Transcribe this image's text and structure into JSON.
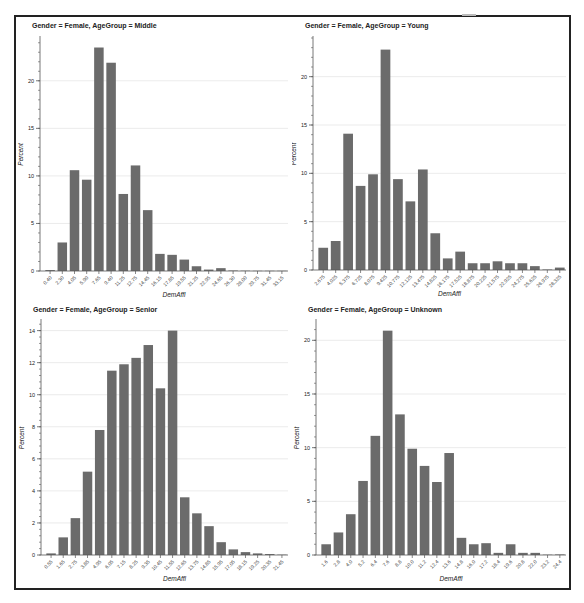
{
  "figure": {
    "bar_color": "#6b6b6b",
    "bar_edge_color": "#ffffff",
    "grid_color": "#e6e6e6",
    "axis_color": "#555555",
    "text_color": "#222222"
  },
  "chart_data": [
    {
      "type": "bar",
      "title": "Gender = Female, AgeGroup = Middle",
      "xlabel": "DemAffl",
      "ylabel": "Percent",
      "ylim": [
        0,
        24.5
      ],
      "yticks": [
        0,
        5,
        10,
        15,
        20
      ],
      "grid": true,
      "categories": [
        "0.40",
        "2.30",
        "4.05",
        "5.90",
        "7.65",
        "9.40",
        "11.25",
        "12.75",
        "14.45",
        "16.15",
        "17.85",
        "19.55",
        "21.25",
        "22.95",
        "24.65",
        "26.30",
        "28.00",
        "29.75",
        "31.45",
        "33.15"
      ],
      "values": [
        0.1,
        3.0,
        10.6,
        9.6,
        23.5,
        21.9,
        8.1,
        11.1,
        6.4,
        1.8,
        1.7,
        1.2,
        0.5,
        0.15,
        0.3,
        0.05,
        0.03,
        0.02,
        0.02,
        0.02
      ]
    },
    {
      "type": "bar",
      "title": "Gender = Female, AgeGroup = Young",
      "xlabel": "DemAffl",
      "ylabel": "Percent",
      "ylim": [
        0,
        24
      ],
      "yticks": [
        0,
        5,
        10,
        15,
        20
      ],
      "grid": true,
      "categories": [
        "2.675",
        "4.025",
        "5.375",
        "6.725",
        "8.075",
        "9.425",
        "10.775",
        "12.125",
        "13.475",
        "14.825",
        "16.175",
        "17.525",
        "18.875",
        "20.225",
        "21.575",
        "22.925",
        "24.275",
        "25.625",
        "26.975",
        "28.325"
      ],
      "values": [
        2.3,
        3.0,
        14.1,
        8.7,
        9.9,
        22.8,
        9.4,
        7.1,
        10.4,
        3.8,
        1.2,
        1.9,
        0.7,
        0.7,
        0.9,
        0.7,
        0.7,
        0.4,
        0.05,
        0.25
      ]
    },
    {
      "type": "bar",
      "title": "Gender = Female, AgeGroup = Senior",
      "xlabel": "DemAffl",
      "ylabel": "Percent",
      "ylim": [
        0,
        14.6
      ],
      "yticks": [
        0,
        2,
        4,
        6,
        8,
        10,
        12,
        14
      ],
      "grid": true,
      "categories": [
        "0.55",
        "1.65",
        "2.75",
        "3.85",
        "4.95",
        "6.05",
        "7.15",
        "8.25",
        "9.35",
        "10.45",
        "11.55",
        "12.65",
        "13.75",
        "14.85",
        "15.95",
        "17.05",
        "18.15",
        "19.25",
        "20.35",
        "21.45"
      ],
      "values": [
        0.1,
        1.1,
        2.3,
        5.2,
        7.8,
        11.5,
        11.9,
        12.3,
        13.1,
        10.4,
        14.0,
        3.6,
        2.6,
        1.8,
        0.8,
        0.35,
        0.18,
        0.1,
        0.06,
        0.02
      ]
    },
    {
      "type": "bar",
      "title": "Gender = Female, AgeGroup = Unknown",
      "xlabel": "DemAffl",
      "ylabel": "Percent",
      "ylim": [
        0,
        21.8
      ],
      "yticks": [
        0,
        5,
        10,
        15,
        20
      ],
      "grid": true,
      "categories": [
        "1.6",
        "2.8",
        "4.0",
        "5.2",
        "6.4",
        "7.6",
        "8.8",
        "10.0",
        "11.2",
        "12.4",
        "13.6",
        "14.8",
        "16.0",
        "17.2",
        "18.4",
        "19.6",
        "20.8",
        "22.0",
        "23.2",
        "24.4"
      ],
      "values": [
        1.0,
        2.1,
        3.8,
        6.9,
        11.1,
        20.9,
        13.1,
        9.9,
        8.3,
        6.8,
        9.5,
        1.6,
        1.0,
        1.1,
        0.2,
        1.0,
        0.2,
        0.2,
        0.03,
        0.05
      ]
    }
  ]
}
